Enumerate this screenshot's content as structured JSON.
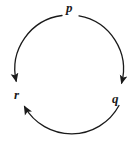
{
  "figure": {
    "kind": "directed-cycle-diagram",
    "background_color": "#ffffff",
    "stroke_color": "#1a1a1a",
    "width": 139,
    "height": 142
  },
  "nodes": [
    {
      "id": "p",
      "label": "p",
      "position": "top",
      "x": 69,
      "y": 8
    },
    {
      "id": "q",
      "label": "q",
      "position": "bottom-right",
      "x": 117,
      "y": 99
    },
    {
      "id": "r",
      "label": "r",
      "position": "bottom-left",
      "x": 18,
      "y": 94
    }
  ],
  "edges": [
    {
      "id": "p-to-r",
      "from": "p",
      "to": "r",
      "direction": "counterclockwise",
      "arrowhead_at": "r"
    },
    {
      "id": "p-to-q",
      "from": "p",
      "to": "q",
      "direction": "clockwise",
      "arrowhead_at": "q"
    },
    {
      "id": "q-to-r",
      "from": "q",
      "to": "r",
      "direction": "along-bottom",
      "arrowhead_at": "r"
    }
  ],
  "geometry": {
    "circle_center_x": 69,
    "circle_center_y": 70,
    "circle_radius": 54,
    "stroke_width": 1.3
  }
}
